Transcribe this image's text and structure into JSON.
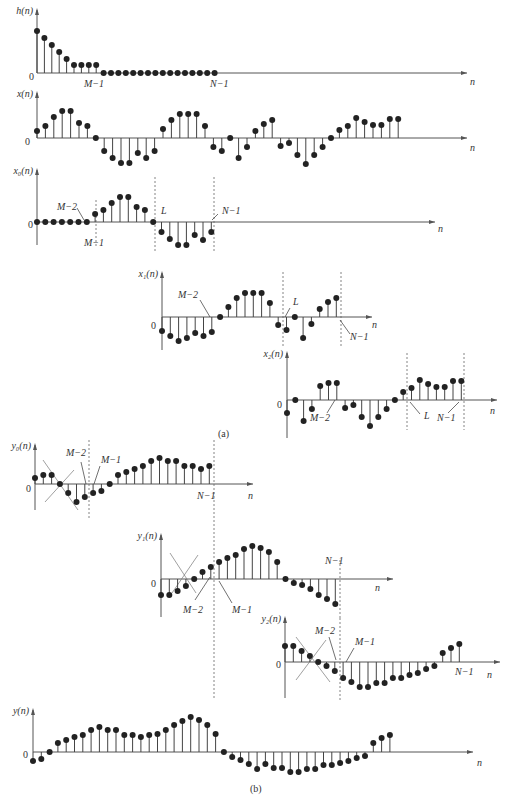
{
  "captions": {
    "a": "(a)",
    "b": "(b)"
  },
  "plots": [
    {
      "id": "h",
      "label": "h(n)",
      "ox": 37,
      "oy": 73,
      "len": 430,
      "top": 10,
      "bottom": 0,
      "dx": 7.4,
      "nlabel": "n",
      "nlx": 470,
      "nly": 85,
      "values": [
        42,
        35,
        28,
        21,
        14,
        8,
        8,
        8,
        8,
        0,
        0,
        0,
        0,
        0,
        0,
        0,
        0,
        0,
        0,
        0,
        0,
        0,
        0,
        0,
        0
      ],
      "marks": [
        {
          "text": "M−1",
          "x": 84,
          "y": 87
        },
        {
          "text": "N−1",
          "x": 210,
          "y": 87
        }
      ],
      "dashes": [],
      "zero": {
        "x": 29,
        "y": 80
      }
    },
    {
      "id": "x",
      "label": "x(n)",
      "ox": 37,
      "oy": 138,
      "len": 430,
      "top": 93,
      "bottom": 0,
      "dx": 8.4,
      "nlabel": "n",
      "nlx": 470,
      "nly": 151,
      "values": [
        7,
        12,
        21,
        27,
        27,
        15,
        12,
        0,
        -13,
        -20,
        -25,
        -25,
        -15,
        -20,
        -13,
        9,
        18,
        24,
        24,
        24,
        12,
        -9,
        -13,
        0,
        -20,
        -9,
        7,
        14,
        18,
        -8,
        -5,
        -17,
        -26,
        -17,
        -9,
        0,
        8,
        12,
        20,
        16,
        13,
        13,
        19,
        19
      ],
      "marks": [],
      "dashes": [],
      "zero": {
        "x": 25,
        "y": 145
      }
    },
    {
      "id": "x0",
      "label": "x₀(n)",
      "ox": 37,
      "oy": 222,
      "len": 398,
      "top": 170,
      "bottom": 245,
      "dx": 8.3,
      "nlabel": "n",
      "nlx": 438,
      "nly": 232,
      "values": [
        0,
        0,
        0,
        0,
        0,
        0,
        0,
        8,
        12,
        19,
        25,
        25,
        15,
        12,
        0,
        -10,
        -17,
        -23,
        -23,
        -13,
        -18,
        -10
      ],
      "marks": [
        {
          "text": "M−2",
          "x": 57,
          "y": 210
        },
        {
          "text": "M−1",
          "x": 84,
          "y": 246
        },
        {
          "text": "L",
          "x": 161,
          "y": 214
        },
        {
          "text": "N−1",
          "x": 222,
          "y": 214
        }
      ],
      "dashes": [
        {
          "x": 96,
          "y1": 200,
          "y2": 247
        },
        {
          "x": 155,
          "y1": 177,
          "y2": 252
        },
        {
          "x": 214,
          "y1": 177,
          "y2": 252
        }
      ],
      "leaders": [
        {
          "x1": 77,
          "y1": 208,
          "x2": 84,
          "y2": 220
        },
        {
          "x1": 218,
          "y1": 214,
          "x2": 212,
          "y2": 220
        }
      ],
      "zero": {
        "x": 28,
        "y": 228
      }
    },
    {
      "id": "x1",
      "label": "x₁(n)",
      "ox": 162,
      "oy": 317,
      "len": 210,
      "top": 273,
      "bottom": 350,
      "dx": 8.3,
      "nlabel": "n",
      "nlx": 372,
      "nly": 328,
      "values": [
        -14,
        -19,
        -24,
        -21,
        -16,
        -19,
        -15,
        0,
        10,
        19,
        24,
        24,
        24,
        14,
        -8,
        -13,
        0,
        -21,
        -7,
        8,
        15,
        19
      ],
      "marks": [
        {
          "text": "M−2",
          "x": 178,
          "y": 298
        },
        {
          "text": "L",
          "x": 293,
          "y": 305
        },
        {
          "text": "N−1",
          "x": 350,
          "y": 340
        }
      ],
      "dashes": [
        {
          "x": 283,
          "y1": 272,
          "y2": 348
        },
        {
          "x": 341,
          "y1": 272,
          "y2": 348
        }
      ],
      "leaders": [
        {
          "x1": 200,
          "y1": 300,
          "x2": 210,
          "y2": 317
        },
        {
          "x1": 290,
          "y1": 308,
          "x2": 285,
          "y2": 317
        },
        {
          "x1": 350,
          "y1": 334,
          "x2": 340,
          "y2": 320
        }
      ],
      "zero": {
        "x": 151,
        "y": 329
      }
    },
    {
      "id": "x2",
      "label": "x₂(n)",
      "ox": 287,
      "oy": 400,
      "len": 210,
      "top": 353,
      "bottom": 438,
      "dx": 8.3,
      "nlabel": "n",
      "nlx": 490,
      "nly": 414,
      "values": [
        -13,
        0,
        -21,
        -9,
        14,
        17,
        17,
        -8,
        -5,
        -17,
        -26,
        -17,
        -9,
        0,
        8,
        12,
        20,
        16,
        13,
        13,
        19,
        19
      ],
      "marks": [
        {
          "text": "M−2",
          "x": 310,
          "y": 421
        },
        {
          "text": "L",
          "x": 424,
          "y": 419
        },
        {
          "text": "N−1",
          "x": 437,
          "y": 421
        }
      ],
      "dashes": [
        {
          "x": 407,
          "y1": 353,
          "y2": 430
        },
        {
          "x": 464,
          "y1": 353,
          "y2": 430
        }
      ],
      "leaders": [
        {
          "x1": 327,
          "y1": 413,
          "x2": 335,
          "y2": 400
        },
        {
          "x1": 420,
          "y1": 414,
          "x2": 410,
          "y2": 402
        },
        {
          "x1": 448,
          "y1": 413,
          "x2": 459,
          "y2": 402
        }
      ],
      "zero": {
        "x": 277,
        "y": 408
      }
    },
    {
      "id": "y0",
      "label": "y₀(n)",
      "ox": 35,
      "oy": 484,
      "len": 218,
      "top": 445,
      "bottom": 510,
      "dx": 8.3,
      "nlabel": "n",
      "nlx": 248,
      "nly": 499,
      "values": [
        6,
        9,
        9,
        0,
        -9,
        -18,
        -13,
        -9,
        -7,
        0,
        9,
        12,
        15,
        18,
        23,
        26,
        23,
        23,
        18,
        18,
        15,
        18
      ],
      "marks": [
        {
          "text": "M−2",
          "x": 66,
          "y": 456
        },
        {
          "text": "M−1",
          "x": 101,
          "y": 463
        },
        {
          "text": "N−1",
          "x": 197,
          "y": 499
        }
      ],
      "dashes": [
        {
          "x": 89,
          "y1": 440,
          "y2": 518
        },
        {
          "x": 214,
          "y1": 440,
          "y2": 700
        }
      ],
      "crosses": [
        {
          "x1": 43,
          "y1": 460,
          "x2": 78,
          "y2": 510
        },
        {
          "x1": 45,
          "y1": 502,
          "x2": 74,
          "y2": 470
        }
      ],
      "leaders": [
        {
          "x1": 81,
          "y1": 462,
          "x2": 86,
          "y2": 484
        },
        {
          "x1": 100,
          "y1": 466,
          "x2": 94,
          "y2": 484
        }
      ],
      "zero": {
        "x": 26,
        "y": 492
      }
    },
    {
      "id": "y1",
      "label": "y₁(n)",
      "ox": 161,
      "oy": 579,
      "len": 232,
      "top": 535,
      "bottom": 617,
      "dx": 8.3,
      "nlabel": "n",
      "nlx": 375,
      "nly": 591,
      "values": [
        -16,
        -16,
        -12,
        -7,
        0,
        7,
        12,
        17,
        21,
        24,
        30,
        33,
        31,
        27,
        17,
        0,
        -4,
        -6,
        -10,
        -16,
        -20,
        -25
      ],
      "marks": [
        {
          "text": "N−1",
          "x": 325,
          "y": 564
        },
        {
          "text": "M−2",
          "x": 183,
          "y": 613
        },
        {
          "text": "M−1",
          "x": 232,
          "y": 613
        }
      ],
      "dashes": [
        {
          "x": 340,
          "y1": 560,
          "y2": 620
        }
      ],
      "crosses": [
        {
          "x1": 170,
          "y1": 553,
          "x2": 196,
          "y2": 593
        },
        {
          "x1": 172,
          "y1": 593,
          "x2": 198,
          "y2": 555
        }
      ],
      "leaders": [
        {
          "x1": 195,
          "y1": 600,
          "x2": 210,
          "y2": 577
        },
        {
          "x1": 232,
          "y1": 603,
          "x2": 219,
          "y2": 581
        }
      ],
      "zero": {
        "x": 151,
        "y": 587
      }
    },
    {
      "id": "y2",
      "label": "y₂(n)",
      "ox": 285,
      "oy": 662,
      "len": 215,
      "top": 618,
      "bottom": 698,
      "dx": 8.3,
      "nlabel": "n",
      "nlx": 487,
      "nly": 678,
      "values": [
        16,
        16,
        11,
        6,
        0,
        -4,
        -9,
        -16,
        -20,
        -25,
        -25,
        -21,
        -21,
        -16,
        -16,
        -13,
        -11,
        -7,
        -4,
        9,
        14,
        18
      ],
      "marks": [
        {
          "text": "M−2",
          "x": 315,
          "y": 634
        },
        {
          "text": "M−1",
          "x": 355,
          "y": 645
        },
        {
          "text": "N−1",
          "x": 455,
          "y": 675
        }
      ],
      "dashes": [
        {
          "x": 340,
          "y1": 618,
          "y2": 700
        }
      ],
      "crosses": [
        {
          "x1": 296,
          "y1": 637,
          "x2": 330,
          "y2": 682
        },
        {
          "x1": 296,
          "y1": 680,
          "x2": 326,
          "y2": 640
        }
      ],
      "leaders": [
        {
          "x1": 329,
          "y1": 637,
          "x2": 336,
          "y2": 660
        },
        {
          "x1": 354,
          "y1": 648,
          "x2": 346,
          "y2": 662
        }
      ],
      "zero": {
        "x": 276,
        "y": 668
      }
    },
    {
      "id": "y",
      "label": "y(n)",
      "ox": 33,
      "oy": 752,
      "len": 440,
      "top": 710,
      "bottom": 0,
      "dx": 8.3,
      "nlabel": "n",
      "nlx": 477,
      "nly": 766,
      "values": [
        -9,
        -7,
        0,
        9,
        12,
        15,
        17,
        22,
        25,
        22,
        22,
        17,
        17,
        15,
        17,
        18,
        22,
        27,
        31,
        35,
        32,
        27,
        18,
        0,
        -5,
        -8,
        -12,
        -17,
        -12,
        -16,
        -16,
        -20,
        -20,
        -17,
        -17,
        -13,
        -13,
        -11,
        -9,
        -6,
        -4,
        9,
        14,
        17
      ],
      "marks": [],
      "dashes": [],
      "zero": {
        "x": 23,
        "y": 758
      }
    }
  ]
}
